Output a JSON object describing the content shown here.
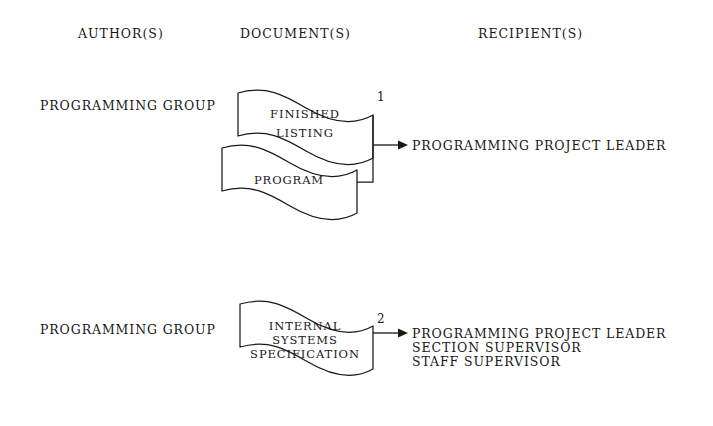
{
  "page": {
    "background_color": "#ffffff",
    "ink_color": "#181818"
  },
  "columns": {
    "headers": [
      {
        "id": "authors",
        "label": "AUTHOR(S)"
      },
      {
        "id": "documents",
        "label": "DOCUMENT(S)"
      },
      {
        "id": "recipients",
        "label": "RECIPIENT(S)"
      }
    ]
  },
  "flows": [
    {
      "number": "1",
      "author": "PROGRAMMING GROUP",
      "documents": [
        {
          "lines": [
            "FINISHED",
            "LISTING"
          ]
        },
        {
          "lines": [
            "PROGRAM"
          ]
        }
      ],
      "recipients": [
        "PROGRAMMING PROJECT LEADER"
      ]
    },
    {
      "number": "2",
      "author": "PROGRAMMING GROUP",
      "documents": [
        {
          "lines": [
            "INTERNAL",
            "SYSTEMS",
            "SPECIFICATION"
          ]
        }
      ],
      "recipients": [
        "PROGRAMMING PROJECT LEADER",
        "SECTION SUPERVISOR",
        "STAFF SUPERVISOR"
      ]
    }
  ]
}
